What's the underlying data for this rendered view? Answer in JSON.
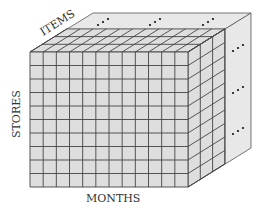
{
  "diagram": {
    "type": "data-cube",
    "axes": {
      "items_label": "ITEMS",
      "stores_label": "STORES",
      "months_label": "MONTHS"
    },
    "front_grid": {
      "columns": 12,
      "rows": 10
    },
    "depth_layers_shown": 3,
    "continuation_marks": {
      "top": [
        "…",
        "…",
        "…"
      ],
      "side": [
        "…",
        "…",
        "…"
      ]
    },
    "colors": {
      "face": "#dedede",
      "face_light": "#e8e8e8",
      "line": "#444444",
      "background": "#ffffff"
    }
  }
}
